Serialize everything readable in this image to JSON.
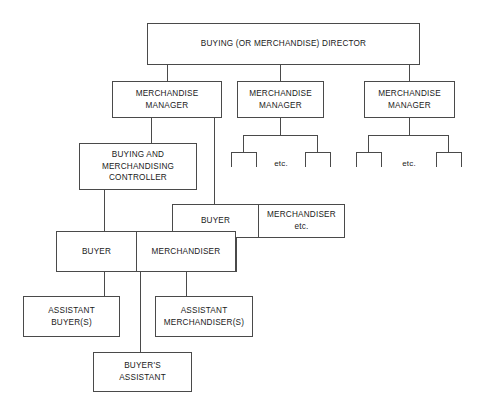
{
  "diagram": {
    "title_text": "BUYING (OR MERCHANDISE) DIRECTOR",
    "nodes": {
      "director": "BUYING (OR MERCHANDISE) DIRECTOR",
      "manager_1": "MERCHANDISE\nMANAGER",
      "manager_2": "MERCHANDISE\nMANAGER",
      "manager_3": "MERCHANDISE\nMANAGER",
      "controller": "BUYING AND\nMERCHANDISING\nCONTROLLER",
      "upper_buyer": "BUYER",
      "upper_merchandiser": "MERCHANDISER\netc.",
      "lower_buyer": "BUYER",
      "lower_merchandiser": "MERCHANDISER",
      "assistant_buyers": "ASSISTANT\nBUYER(S)",
      "assistant_merchandisers": "ASSISTANT\nMERCHANDISER(S)",
      "buyers_assistant": "BUYER'S\nASSISTANT"
    },
    "etc_labels": {
      "branch_2": "etc.",
      "branch_3": "etc."
    },
    "colors": {
      "background": "#ffffff",
      "box_border": "#4a4a4a",
      "connector": "#4a4a4a",
      "text": "#1a1a1a"
    }
  }
}
